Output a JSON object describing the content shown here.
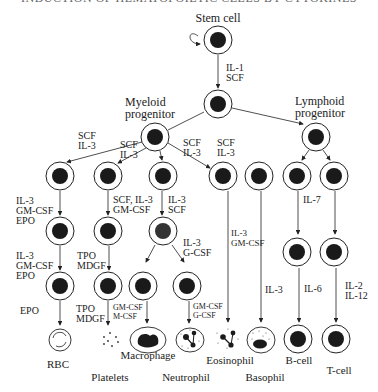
{
  "header": {
    "cut_off_text": "INDUCTION OF HEMATOPOIETIC CELLS BY CYTOKINES"
  },
  "colors": {
    "stroke": "#222222",
    "nucleus": "#1a1a1a",
    "text": "#222222"
  },
  "nodes": {
    "stem_cell": {
      "label": "Stem cell",
      "x": 218,
      "y": 40
    },
    "progenitor": {
      "x": 218,
      "y": 104
    },
    "myeloid": {
      "label": [
        "Myeloid",
        "progenitor"
      ],
      "x": 158,
      "y": 140
    },
    "lymphoid": {
      "label": [
        "Lymphoid",
        "progenitor"
      ],
      "x": 311,
      "y": 139
    }
  },
  "cytokines": {
    "stem_to_prog": [
      "IL-1",
      "SCF"
    ],
    "myeloid_to_erythroid": [
      "SCF",
      "IL-3"
    ],
    "myeloid_to_mega": [
      "SCF",
      "IL-3"
    ],
    "myeloid_to_eos_a": [
      "SCF",
      "IL-3"
    ],
    "myeloid_to_eos_b": [
      "SCF",
      "IL-3"
    ],
    "erythroid_1": [
      "IL-3",
      "GM-CSF",
      "EPO"
    ],
    "erythroid_2": [
      "IL-3",
      "GM-CSF",
      "EPO"
    ],
    "erythroid_3": [
      "EPO"
    ],
    "mega_1": [
      "SCF, IL-3",
      "GM-CSF"
    ],
    "mega_2": [
      "TPO",
      "MDGF"
    ],
    "mega_3": [
      "TPO",
      "MDGF"
    ],
    "gm_1": [
      "IL-3",
      "SCF"
    ],
    "gm_2": [
      "IL-3",
      "G-CSF"
    ],
    "macro": [
      "GM-CSF",
      "M-CSF"
    ],
    "neutro": [
      "GM-CSF",
      "G-CSF"
    ],
    "eos": [
      "IL-3",
      "GM-CSF"
    ],
    "baso": [
      "IL-3"
    ],
    "lymph_1": [
      "IL-7"
    ],
    "bcell": [
      "IL-6"
    ],
    "tcell": [
      "IL-2",
      "IL-12"
    ]
  },
  "end_cells": {
    "rbc": "RBC",
    "platelets": "Platelets",
    "macrophage": "Macrophage",
    "neutrophil": "Neutrophil",
    "eosinophil": "Eosinophil",
    "basophil": "Basophil",
    "bcell": "B-cell",
    "tcell": "T-cell"
  }
}
